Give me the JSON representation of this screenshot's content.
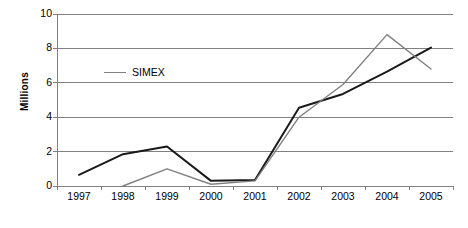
{
  "chart_data": {
    "type": "line",
    "title": "",
    "xlabel": "",
    "ylabel": "Millions",
    "categories": [
      "1997",
      "1998",
      "1999",
      "2000",
      "2001",
      "2002",
      "2003",
      "2004",
      "2005"
    ],
    "ylim": [
      0,
      10
    ],
    "yticks": [
      0,
      2,
      4,
      6,
      8,
      10
    ],
    "ytick_labels": [
      "0",
      "2",
      "4",
      "6",
      "8",
      "10"
    ],
    "grid": true,
    "grid_axis": "y",
    "legend_position": "inside-upper-left",
    "series": [
      {
        "name": "",
        "color": "#1a1a1a",
        "in_legend": false,
        "values": [
          0.65,
          1.85,
          2.3,
          0.3,
          0.35,
          4.55,
          5.35,
          6.65,
          8.05
        ]
      },
      {
        "name": "SIMEX",
        "color": "#808080",
        "in_legend": true,
        "values": [
          null,
          0.0,
          1.0,
          0.1,
          0.3,
          4.0,
          5.9,
          8.8,
          6.8
        ]
      }
    ]
  },
  "axis": {
    "y_title": "Millions"
  },
  "legend": {
    "entries": [
      {
        "label": "SIMEX",
        "color": "#808080"
      }
    ]
  },
  "style": {
    "axis_color": "#808080",
    "grid_color": "#808080",
    "text_color": "#000000",
    "background": "#ffffff"
  }
}
